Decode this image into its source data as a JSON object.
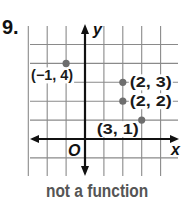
{
  "problem": {
    "number": "9."
  },
  "caption": "not a function",
  "colors": {
    "grid": "#8a8a8a",
    "axis": "#111111",
    "point": "#6e6e6e",
    "label": "#1a1a1a",
    "caption": "#555555"
  },
  "chart_data": {
    "type": "scatter",
    "title": "",
    "xlabel": "x",
    "ylabel": "y",
    "origin_label": "O",
    "xlim": [
      -4,
      5
    ],
    "ylim": [
      -2,
      5
    ],
    "grid": true,
    "grid_x": [
      -3,
      -2,
      -1,
      1,
      2,
      3,
      4
    ],
    "grid_y": [
      -1,
      1,
      2,
      3,
      4,
      5
    ],
    "points": [
      {
        "x": -1,
        "y": 4,
        "label": "(−1, 4)",
        "label_dx": -35,
        "label_dy": 12
      },
      {
        "x": 2,
        "y": 3,
        "label": "(2, 3)",
        "label_dx": 3,
        "label_dy": 0
      },
      {
        "x": 2,
        "y": 2,
        "label": "(2, 2)",
        "label_dx": 3,
        "label_dy": 0
      },
      {
        "x": 3,
        "y": 1,
        "label": "(3, 1)",
        "label_dx": -45,
        "label_dy": 9
      }
    ],
    "annotation": "not a function"
  }
}
